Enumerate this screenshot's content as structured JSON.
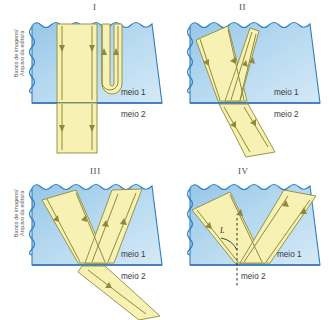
{
  "figure": {
    "title_hidden": "",
    "credit_line": "Banco de imagens/\nArquivo da editora",
    "medium_upper_label": "meio 1",
    "medium_lower_label": "meio 2",
    "angle_label": "L",
    "colors": {
      "water_top": "#9dc9e8",
      "water_bottom": "#cfe6f5",
      "water_edge": "#2f7fbf",
      "beam_fill": "#f7f1b4",
      "beam_stroke": "#8f8a3a",
      "boundary_line": "#2f6fae",
      "label_text": "#3a3a40",
      "roman_text": "#4a4a52",
      "credit_text": "#5b5b5b",
      "page_background": "#ffffff"
    },
    "panels": [
      {
        "id": "panel-1",
        "roman": "I",
        "medium_upper": "meio 1",
        "medium_lower": "meio 2",
        "description": "Wide vertical beam passing straight down through the boundary, plus a narrow beam that makes a U-turn inside medium 1",
        "rays": [
          {
            "name": "incident-wide-beam",
            "direction": "down"
          },
          {
            "name": "transmitted-wide-beam",
            "direction": "down"
          },
          {
            "name": "u-turn-beam",
            "direction": "down-then-up"
          }
        ]
      },
      {
        "id": "panel-2",
        "roman": "II",
        "medium_upper": "meio 1",
        "medium_lower": "meio 2",
        "description": "Oblique incident beam from upper left, reflected beam toward upper right, refracted beam continuing into medium 2",
        "rays": [
          {
            "name": "incident-beam",
            "direction": "down-right"
          },
          {
            "name": "reflected-beam",
            "direction": "up-right"
          },
          {
            "name": "refracted-beam",
            "direction": "down-right-steep"
          }
        ]
      },
      {
        "id": "panel-3",
        "roman": "III",
        "medium_upper": "meio 1",
        "medium_lower": "meio 2",
        "description": "Oblique incident beam from upper left, reflected beam toward upper right, refracted beam grazing into medium 2 at a shallow angle",
        "rays": [
          {
            "name": "incident-beam",
            "direction": "down-right"
          },
          {
            "name": "reflected-beam",
            "direction": "up-right"
          },
          {
            "name": "refracted-beam",
            "direction": "down-right-shallow"
          }
        ]
      },
      {
        "id": "panel-4",
        "roman": "IV",
        "medium_upper": "meio 1",
        "medium_lower": "meio 2",
        "angle_label": "L",
        "description": "Total internal reflection: incident beam from upper left, fully reflected toward upper right, dashed normal with marked limit angle L, no refracted beam",
        "rays": [
          {
            "name": "incident-beam",
            "direction": "down-right"
          },
          {
            "name": "reflected-beam",
            "direction": "up-right"
          }
        ],
        "normal": {
          "name": "normal-dashed-line",
          "style": "dashed"
        }
      }
    ]
  }
}
